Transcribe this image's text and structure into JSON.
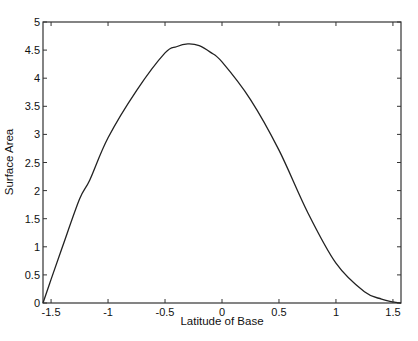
{
  "chart_data": {
    "type": "line",
    "title": "",
    "xlabel": "Latitude of Base",
    "ylabel": "Surface Area",
    "xlim": [
      -1.5708,
      1.5708
    ],
    "ylim": [
      0,
      5
    ],
    "grid": false,
    "legend": null,
    "xticks": [
      -1.5,
      -1,
      -0.5,
      0,
      0.5,
      1,
      1.5
    ],
    "xtick_labels": [
      "-1.5",
      "-1",
      "-0.5",
      "0",
      "0.5",
      "1",
      "1.5"
    ],
    "yticks": [
      0,
      0.5,
      1,
      1.5,
      2,
      2.5,
      3,
      3.5,
      4,
      4.5,
      5
    ],
    "ytick_labels": [
      "0",
      "0.5",
      "1",
      "1.5",
      "2",
      "2.5",
      "3",
      "3.5",
      "4",
      "4.5",
      "5"
    ],
    "series": [
      {
        "name": "Surface Area",
        "color": "#222222",
        "x": [
          -1.5708,
          -1.5,
          -1.4,
          -1.25,
          -1.16,
          -1.0,
          -0.75,
          -0.5,
          -0.4,
          -0.3,
          -0.2,
          -0.1,
          0.0,
          0.25,
          0.5,
          0.75,
          1.0,
          1.25,
          1.4,
          1.5,
          1.5708
        ],
        "y": [
          0.0,
          0.42,
          1.0,
          1.85,
          2.19,
          2.94,
          3.78,
          4.45,
          4.56,
          4.61,
          4.58,
          4.46,
          4.29,
          3.62,
          2.72,
          1.62,
          0.71,
          0.2,
          0.07,
          0.02,
          0.0
        ]
      }
    ]
  }
}
